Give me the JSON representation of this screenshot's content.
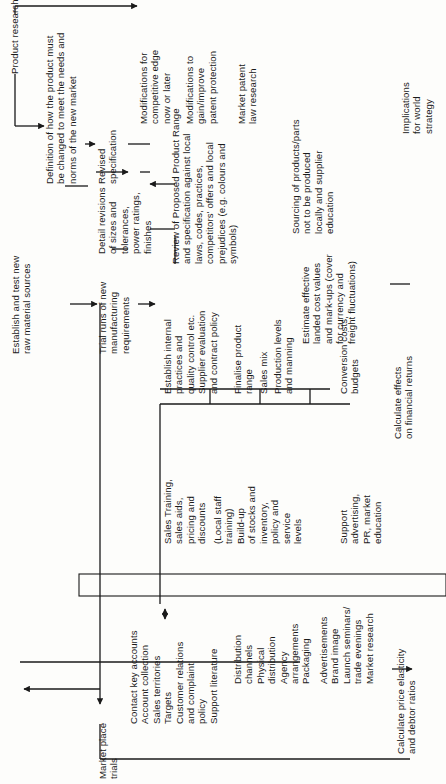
{
  "diagram": {
    "nodes": {
      "product_research": "Product research",
      "definition": "Definition of how the product must\nbe changed to meet the needs and\nnorms of the new market",
      "establish_raw": "Establish and test new\nraw material sources",
      "revised_spec": "Revised\nspecification",
      "detail_revisions": "Detail revisions\nof sizes and\ntolerances,\npower ratings,\nfinishes",
      "trial_runs": "Trial runs of new\nmanufacturing\nrequirements",
      "market_place_trials": "Market place\ntrials",
      "mods_competitive": "Modifications for\ncompetitive edge\nnow or later",
      "mods_patent": "Modifications to\ngain/improve\npatent protection",
      "market_patent": "Market patent\nlaw research",
      "review_range": "Review of Proposed Product Range\nand specification against local\nlaws, codes, practices,\ncompetitors' offers and local\nprejudices (e.g. colours and\nsymbols)",
      "establish_internal": "Establish internal\npractices and\nquality control etc.\nSupplier evaluation\nand contract policy",
      "sales_training": "Sales Training,\nsales aids,\npricing and\ndiscounts",
      "local_staff": "(Local staff\ntraining)",
      "finalise_range": "Finalise product\nrange",
      "sales_mix": "Sales mix",
      "production_levels": "Production levels\nand manning",
      "build_up": "Build-up\nof stocks and\ninventory,\npolicy and\nservice\nlevels",
      "conversion_costs": "Conversion costs,\nbudgets",
      "support_advertising": "Support\nadvertising,\nPR, market\neducation",
      "sourcing": "Sourcing of products/parts\nnot to be produced\nlocally and supplier\neducation",
      "estimate_landed": "Estimate effective\nlanded cost values\nand mark-ups (cover\nfor currency and\nfreight fluctuations)",
      "calc_financial": "Calculate effects\non financial returns",
      "calc_price": "Calculate price elasticity\nand debtor ratios",
      "implications": "Implications\nfor world\nstrategy"
    },
    "customer_lists": {
      "sales": "Contact key accounts\nAccount collection\nSales territories\nTargets\nCustomer relations\nand complaint\npolicy\nSupport literature",
      "distribution": "Distribution\nchannels\nPhysical\ndistribution\nAgency\narrangements\nPackaging",
      "promotion": "Advertisements\nBrand image\nLaunch seminars/\ntrade evenings\nMarket research"
    },
    "interface_box": {
      "left_label": "INTERFACE",
      "right_label": "CUSTOMER"
    }
  }
}
